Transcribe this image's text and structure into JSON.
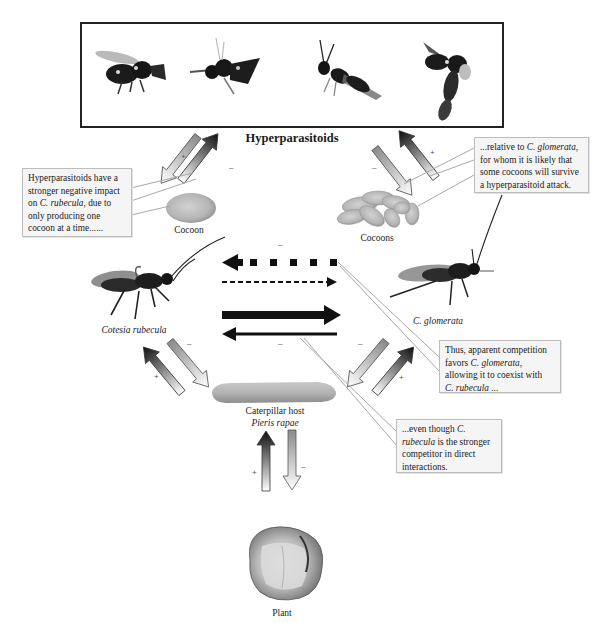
{
  "diagram": {
    "title": "Hyperparasitoids",
    "nodes": {
      "hyperparasitoids": {
        "label": "Hyperparasitoids",
        "image_count": 4
      },
      "cocoon_left": {
        "label": "Cocoon"
      },
      "cocoons_right": {
        "label": "Cocoons"
      },
      "c_rubecula": {
        "label": "Cotesia rubecula"
      },
      "c_glomerata": {
        "label": "C. glomerata"
      },
      "caterpillar": {
        "label": "Caterpillar host",
        "sublabel": "Pieris rapae"
      },
      "plant": {
        "label": "Plant"
      }
    },
    "callouts": {
      "left": {
        "line1": "Hyperparasitoids have a",
        "line2": "stronger negative impact",
        "line3_pre": "on ",
        "line3_em": "C. rubecula",
        "line3_post": ", due to",
        "line4": "only producing one",
        "line5": "cocoon at a time......"
      },
      "right_top": {
        "line1_pre": "...relative to ",
        "line1_em": "C. glomerata",
        "line1_post": ",",
        "line2": "for whom it is likely that",
        "line3": "some cocoons will survive",
        "line4": "a hyperparasitoid attack."
      },
      "right_mid": {
        "line1": "Thus, apparent competition",
        "line2_pre": "favors ",
        "line2_em": "C. glomerata",
        "line2_post": ",",
        "line3": "allowing it to coexist with",
        "line4_em": "C. rubecula",
        "line4_post": " ..."
      },
      "bottom": {
        "line1_pre": "...even though ",
        "line1_em": "C.",
        "line2_em": "rubecula",
        "line2_post": " is the stronger",
        "line3": "competitor in direct",
        "line4": "interactions."
      }
    },
    "signs": {
      "plus": "+",
      "minus": "–"
    },
    "interactions": [
      {
        "from": "C. glomerata",
        "to": "Cotesia rubecula",
        "style": "dotted-square",
        "sign": "–"
      },
      {
        "from": "Cotesia rubecula",
        "to": "C. glomerata",
        "style": "dashed"
      },
      {
        "from": "Cotesia rubecula",
        "to": "C. glomerata",
        "style": "thick-solid"
      },
      {
        "from": "C. glomerata",
        "to": "Cotesia rubecula",
        "style": "thin-solid",
        "sign": "–"
      }
    ],
    "colors": {
      "frame": "#222222",
      "callout_bg": "#f5f5f5",
      "callout_border": "#bdbdbd",
      "arrow_dark": "#111111",
      "arrow_light": "#ffffff",
      "arrow_gray": "#8a8a8a"
    }
  }
}
